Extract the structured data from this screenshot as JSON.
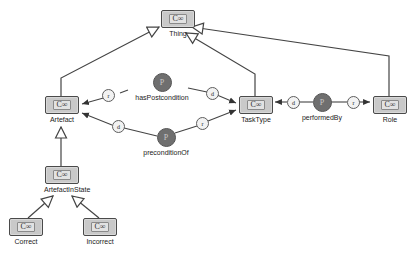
{
  "diagram": {
    "background_color": "#ffffff",
    "class_fill_color": "#c9c9c9",
    "class_border_color": "#4a4a4a",
    "property_fill_color": "#6f6f6f",
    "edge_color": "#333333"
  },
  "class_icon": "C∞",
  "property_icon": "P",
  "classes": [
    {
      "id": "thing",
      "label": "Thing",
      "icon": "C∞",
      "x": 160,
      "y": 10
    },
    {
      "id": "artefact",
      "label": "Artefact",
      "icon": "C∞",
      "x": 44,
      "y": 96
    },
    {
      "id": "tasktype",
      "label": "TaskType",
      "icon": "C∞",
      "x": 238,
      "y": 96
    },
    {
      "id": "role",
      "label": "Role",
      "icon": "C∞",
      "x": 372,
      "y": 96
    },
    {
      "id": "artefactinstate",
      "label": "ArtefactInState",
      "icon": "C∞",
      "x": 44,
      "y": 166
    },
    {
      "id": "correct",
      "label": "Correct",
      "icon": "C∞",
      "x": 8,
      "y": 218
    },
    {
      "id": "incorrect",
      "label": "Incorrect",
      "icon": "C∞",
      "x": 82,
      "y": 218
    }
  ],
  "properties": [
    {
      "id": "haspostcondition",
      "label": "hasPostcondition",
      "icon": "P",
      "x": 127,
      "y": 73
    },
    {
      "id": "preconditionof",
      "label": "preconditionOf",
      "icon": "P",
      "x": 131,
      "y": 128
    },
    {
      "id": "performedby",
      "label": "performedBy",
      "icon": "P",
      "x": 287,
      "y": 93
    }
  ],
  "edge_markers": [
    {
      "id": "haspostcondition-domain",
      "label": "r",
      "x": 108,
      "y": 90
    },
    {
      "id": "haspostcondition-range",
      "label": "d",
      "x": 207,
      "y": 88
    },
    {
      "id": "preconditionof-domain",
      "label": "d",
      "x": 113,
      "y": 121
    },
    {
      "id": "preconditionof-range",
      "label": "r",
      "x": 197,
      "y": 118
    },
    {
      "id": "performedby-domain",
      "label": "d",
      "x": 288,
      "y": 97
    },
    {
      "id": "performedby-range",
      "label": "r",
      "x": 348,
      "y": 97
    }
  ],
  "subclass_edges": [
    {
      "id": "artefact-thing",
      "from": "Artefact",
      "to": "Thing"
    },
    {
      "id": "tasktype-thing",
      "from": "TaskType",
      "to": "Thing"
    },
    {
      "id": "role-thing",
      "from": "Role",
      "to": "Thing"
    },
    {
      "id": "artefactinstate-artefact",
      "from": "ArtefactInState",
      "to": "Artefact"
    },
    {
      "id": "correct-artefactinstate",
      "from": "Correct",
      "to": "ArtefactInState"
    },
    {
      "id": "incorrect-artefactinstate",
      "from": "Incorrect",
      "to": "ArtefactInState"
    }
  ],
  "property_edges": [
    {
      "id": "haspostcondition-to-artefact",
      "property": "hasPostcondition",
      "target": "Artefact",
      "marker": "r"
    },
    {
      "id": "haspostcondition-to-tasktype",
      "property": "hasPostcondition",
      "target": "TaskType",
      "marker": "d"
    },
    {
      "id": "preconditionof-to-artefact",
      "property": "preconditionOf",
      "target": "Artefact",
      "marker": "d"
    },
    {
      "id": "preconditionof-to-tasktype",
      "property": "preconditionOf",
      "target": "TaskType",
      "marker": "r"
    },
    {
      "id": "performedby-to-tasktype",
      "property": "performedBy",
      "target": "TaskType",
      "marker": "d"
    },
    {
      "id": "performedby-to-role",
      "property": "performedBy",
      "target": "Role",
      "marker": "r"
    }
  ]
}
